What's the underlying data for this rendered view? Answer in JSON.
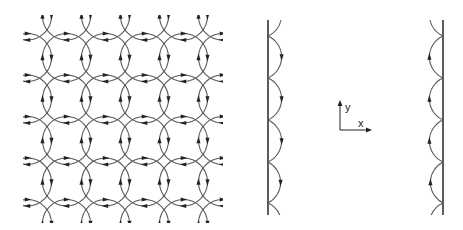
{
  "figure": {
    "colors": {
      "orbit": "#5a5a5a",
      "wall": "#4a4a4a",
      "arrow": "#222222",
      "background": "#ffffff"
    }
  },
  "left_panel": {
    "name": "bulk-cyclotron-orbits",
    "clip": {
      "x": 23,
      "y": 15,
      "w": 200,
      "h": 208
    },
    "circle_radius": 24,
    "centers_x": [
      27.5,
      66.5,
      105.5,
      144.5,
      183.5,
      222.5
    ],
    "centers_y": [
      16,
      57.5,
      99,
      140.5,
      182,
      223.5
    ],
    "rotation": "clockwise"
  },
  "right_panel": {
    "name": "edge-skipping-orbits",
    "left_wall": {
      "x": 268,
      "y1": 20,
      "y2": 215,
      "arrow_direction": "down"
    },
    "right_wall": {
      "x": 443,
      "y1": 20,
      "y2": 215,
      "arrow_direction": "up"
    },
    "bounce_points_y": [
      36,
      78,
      120,
      162,
      203
    ],
    "arc_radius": 23,
    "axes": {
      "origin": [
        340,
        130
      ],
      "y_tip": [
        340,
        100
      ],
      "x_tip": [
        372,
        130
      ],
      "x_label": "x",
      "y_label": "y"
    }
  }
}
